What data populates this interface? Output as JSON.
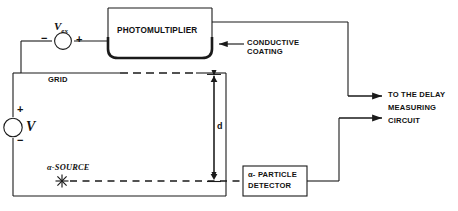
{
  "figure": {
    "background_color": "#ffffff",
    "line_color": "#1a1a1a"
  },
  "components": {
    "photomultiplier": {
      "label": "PHOTOMULTIPLIER",
      "shape": "tube-with-rounded-bottom"
    },
    "excitation_source": {
      "symbol_name": "voltage-source-circle",
      "label_main": "V",
      "label_sub": "ex",
      "terminal_left": "−",
      "terminal_right": "+"
    },
    "bias_source": {
      "symbol_name": "voltage-source-circle",
      "label_main": "V",
      "terminal_top": "+",
      "terminal_bottom": "−"
    },
    "grid": {
      "label": "GRID"
    },
    "conductive_coating": {
      "label_line1": "CONDUCTIVE",
      "label_line2": "COATING"
    },
    "alpha_source": {
      "label": "α-SOURCE",
      "symbol_name": "starburst-icon"
    },
    "alpha_detector": {
      "label_line1": "α- PARTICLE",
      "label_line2": "DETECTOR"
    },
    "dimension": {
      "label": "d",
      "description": "gap between grid and alpha source"
    },
    "output": {
      "label_line1": "TO THE DELAY",
      "label_line2": "MEASURING",
      "label_line3": "CIRCUIT"
    }
  }
}
